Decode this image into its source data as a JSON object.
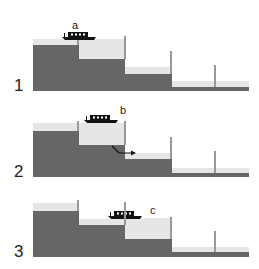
{
  "colors": {
    "ground": "#666666",
    "water": "#e6e6e6",
    "gate": "#999999",
    "boat": "#111111",
    "text": "#222222"
  },
  "panels": [
    {
      "number": "1",
      "boat_label": "a",
      "description": "Boat in top pound entering first lock; lock full",
      "has_flow_arrow": false
    },
    {
      "number": "2",
      "boat_label": "b",
      "description": "Boat in first lock; water released downstream",
      "has_flow_arrow": true
    },
    {
      "number": "3",
      "boat_label": "c",
      "description": "Boat passes into second lock; lock full",
      "has_flow_arrow": false
    }
  ]
}
